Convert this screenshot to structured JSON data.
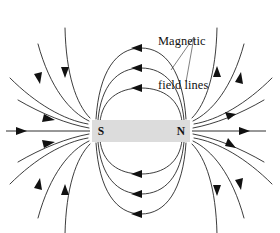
{
  "figure": {
    "kind": "magnetic-field-lines-diagram",
    "background_color": "#ffffff",
    "line_color": "#1a1a1a",
    "width": 280,
    "height": 233
  },
  "annotation": {
    "label_line_1": "Magnetic",
    "label_line_2": "field lines",
    "leader_origin": {
      "x": 194,
      "y": 37
    },
    "leader_targets": [
      {
        "x": 171,
        "y": 70
      },
      {
        "x": 186,
        "y": 82
      }
    ]
  },
  "magnet": {
    "x": 92,
    "y": 120,
    "width": 98,
    "height": 22,
    "fill_color": "#dcdcdc",
    "south_pole_label": "S",
    "north_pole_label": "N",
    "south_pole_x": 101,
    "north_pole_x": 181,
    "center_y": 131
  },
  "chart_data": {
    "type": "diagram",
    "title": "Magnetic field lines",
    "poles": [
      "S",
      "N"
    ],
    "field_direction": "north-to-south outside the magnet",
    "loop_count": 3,
    "outer_line_count": 8,
    "axis_line_count": 2,
    "arrow_count": 20
  }
}
